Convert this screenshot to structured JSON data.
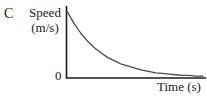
{
  "figure": {
    "panel_letter": "C",
    "y_axis_title": "Speed",
    "y_axis_unit": "(m/s)",
    "origin_label": "0",
    "x_axis_title": "Time (s)",
    "line_color": "#4a4a4a",
    "axis_color": "#1a1a1a",
    "background_color": "#ffffff"
  },
  "chart_data": {
    "type": "line",
    "title": "",
    "xlabel": "Time (s)",
    "ylabel": "Speed (m/s)",
    "xlim": [
      0,
      1
    ],
    "ylim": [
      0,
      1
    ],
    "grid": false,
    "legend": null,
    "annotations": [
      "C",
      "0"
    ],
    "tick_labels": {
      "x": [],
      "y": [
        "0"
      ]
    },
    "series": [
      {
        "name": "Speed vs Time (exponential decay)",
        "description": "Speed starts at a maximum value at t = 0 and decays exponentially toward zero, approaching the time axis asymptotically.",
        "x": [
          0.0,
          0.05,
          0.1,
          0.15,
          0.2,
          0.25,
          0.3,
          0.35,
          0.4,
          0.45,
          0.5,
          0.55,
          0.6,
          0.65,
          0.7,
          0.75,
          0.8,
          0.85,
          0.9,
          0.95,
          1.0
        ],
        "y": [
          1.0,
          0.82,
          0.67,
          0.55,
          0.45,
          0.37,
          0.3,
          0.25,
          0.2,
          0.17,
          0.14,
          0.11,
          0.09,
          0.07,
          0.06,
          0.05,
          0.04,
          0.03,
          0.03,
          0.02,
          0.02
        ]
      }
    ]
  }
}
